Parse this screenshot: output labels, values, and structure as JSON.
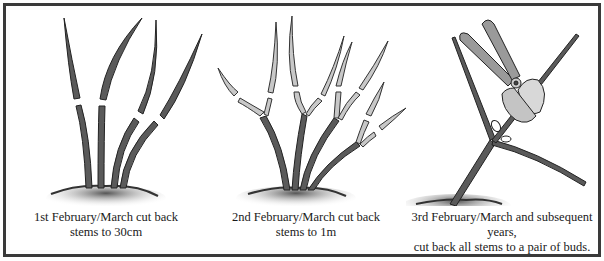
{
  "diagram": {
    "type": "pruning-steps",
    "colors": {
      "border": "#3a3a3a",
      "stem": "#5a5a5a",
      "stem_outline": "#222222",
      "cut_portion": "#c8c8c8",
      "soil": "#3b3b3b",
      "shears": "#9a9a9a"
    },
    "panels": [
      {
        "step": 1,
        "caption_line1": "1st February/March cut back",
        "caption_line2": "stems to 30cm",
        "illustration": "four-tall-stems-with-cut-marks"
      },
      {
        "step": 2,
        "caption_line1": "2nd February/March cut back",
        "caption_line2": "stems to 1m",
        "illustration": "branched-stems-with-cut-tips"
      },
      {
        "step": 3,
        "caption_line1": "3rd February/March and subsequent years,",
        "caption_line2": "cut back all stems to a pair of buds.",
        "illustration": "secateurs-cutting-stem-above-buds"
      }
    ]
  }
}
